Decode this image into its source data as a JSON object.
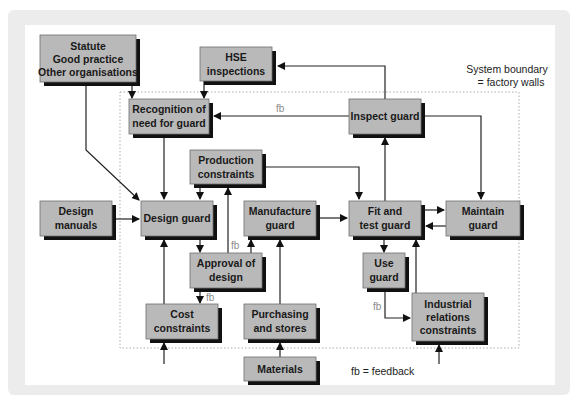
{
  "diagram": {
    "boundary_label": [
      "System boundary",
      "= factory walls"
    ],
    "legend": "fb = feedback",
    "feedback_label": "fb",
    "nodes": {
      "statute": [
        "Statute",
        "Good practice",
        "Other organisations"
      ],
      "hse": [
        "HSE",
        "inspections"
      ],
      "recognition": [
        "Recognition of",
        "need for guard"
      ],
      "inspect": [
        "Inspect guard"
      ],
      "production": [
        "Production",
        "constraints"
      ],
      "design_manuals": [
        "Design",
        "manuals"
      ],
      "design_guard": [
        "Design guard"
      ],
      "manufacture": [
        "Manufacture",
        "guard"
      ],
      "fit_test": [
        "Fit and",
        "test guard"
      ],
      "maintain": [
        "Maintain",
        "guard"
      ],
      "approval": [
        "Approval of",
        "design"
      ],
      "use_guard": [
        "Use",
        "guard"
      ],
      "cost": [
        "Cost",
        "constraints"
      ],
      "purchasing": [
        "Purchasing",
        "and stores"
      ],
      "industrial": [
        "Industrial",
        "relations",
        "constraints"
      ],
      "materials": [
        "Materials"
      ]
    },
    "edges": [
      {
        "from": "statute",
        "to": "recognition"
      },
      {
        "from": "statute",
        "to": "design_guard"
      },
      {
        "from": "hse",
        "to": "recognition"
      },
      {
        "from": "inspect",
        "to": "hse"
      },
      {
        "from": "inspect",
        "to": "recognition",
        "label": "fb"
      },
      {
        "from": "inspect",
        "to": "maintain"
      },
      {
        "from": "recognition",
        "to": "design_guard"
      },
      {
        "from": "production",
        "to": "design_guard"
      },
      {
        "from": "production",
        "to": "fit_test"
      },
      {
        "from": "approval",
        "to": "production",
        "label": "fb"
      },
      {
        "from": "design_manuals",
        "to": "design_guard"
      },
      {
        "from": "design_guard",
        "to": "approval"
      },
      {
        "from": "approval",
        "to": "manufacture"
      },
      {
        "from": "approval",
        "to": "cost",
        "label": "fb"
      },
      {
        "from": "cost",
        "to": "design_guard"
      },
      {
        "from": "manufacture",
        "to": "fit_test"
      },
      {
        "from": "purchasing",
        "to": "manufacture"
      },
      {
        "from": "materials",
        "to": "purchasing"
      },
      {
        "from": "fit_test",
        "to": "maintain"
      },
      {
        "from": "maintain",
        "to": "fit_test"
      },
      {
        "from": "fit_test",
        "to": "inspect"
      },
      {
        "from": "fit_test",
        "to": "use_guard"
      },
      {
        "from": "use_guard",
        "to": "industrial",
        "label": "fb"
      },
      {
        "from": "industrial",
        "to": "fit_test"
      }
    ]
  }
}
